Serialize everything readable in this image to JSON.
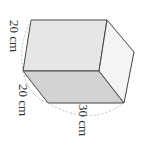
{
  "figure": {
    "type": "rectangular prism (box)",
    "orientation": "rotated 90 degrees clockwise",
    "dimensions": [
      {
        "name": "height",
        "label": "20 cm"
      },
      {
        "name": "width",
        "label": "20 cm"
      },
      {
        "name": "length",
        "label": "30 cm"
      }
    ],
    "colors": {
      "top_face": "#e6e6e6",
      "front_face": "#d2d2d2",
      "side_face": "#f4f4f4",
      "edge": "#444444",
      "dimension_arc": "#aaaaaa"
    }
  }
}
